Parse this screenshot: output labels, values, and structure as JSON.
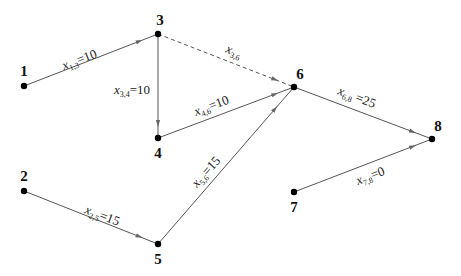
{
  "diagram": {
    "type": "directed-network-flow",
    "nodes": [
      {
        "id": "1",
        "label": "1",
        "x": 24,
        "y": 86,
        "lx": 24,
        "ly": 76,
        "anchor": "middle"
      },
      {
        "id": "2",
        "label": "2",
        "x": 24,
        "y": 191,
        "lx": 24,
        "ly": 181,
        "anchor": "middle"
      },
      {
        "id": "3",
        "label": "3",
        "x": 158,
        "y": 34,
        "lx": 160,
        "ly": 25,
        "anchor": "middle"
      },
      {
        "id": "4",
        "label": "4",
        "x": 158,
        "y": 138,
        "lx": 158,
        "ly": 158,
        "anchor": "middle"
      },
      {
        "id": "5",
        "label": "5",
        "x": 158,
        "y": 244,
        "lx": 158,
        "ly": 264,
        "anchor": "middle"
      },
      {
        "id": "6",
        "label": "6",
        "x": 294,
        "y": 87,
        "lx": 300,
        "ly": 79,
        "anchor": "middle"
      },
      {
        "id": "7",
        "label": "7",
        "x": 294,
        "y": 192,
        "lx": 294,
        "ly": 212,
        "anchor": "middle"
      },
      {
        "id": "8",
        "label": "8",
        "x": 432,
        "y": 139,
        "lx": 438,
        "ly": 131,
        "anchor": "middle"
      }
    ],
    "edges": [
      {
        "from": "1",
        "to": "3",
        "var": "x",
        "sub": "1,3",
        "value": "=10",
        "dashed": false,
        "lx": 64,
        "ly": 70,
        "rot": -21
      },
      {
        "from": "3",
        "to": "4",
        "var": "x",
        "sub": "3,4",
        "value": "=10",
        "dashed": false,
        "lx": 114,
        "ly": 94,
        "rot": 0
      },
      {
        "from": "3",
        "to": "6",
        "var": "x",
        "sub": "3,6",
        "value": "",
        "dashed": true,
        "lx": 225,
        "ly": 52,
        "rot": 22
      },
      {
        "from": "4",
        "to": "6",
        "var": "x",
        "sub": "4,6",
        "value": "=10",
        "dashed": false,
        "lx": 196,
        "ly": 116,
        "rot": -21
      },
      {
        "from": "5",
        "to": "6",
        "var": "x",
        "sub": "5,6",
        "value": "=15",
        "dashed": false,
        "lx": 197,
        "ly": 188,
        "rot": -48
      },
      {
        "from": "2",
        "to": "5",
        "var": "x",
        "sub": "2,5",
        "value": "=15",
        "dashed": false,
        "lx": 84,
        "ly": 213,
        "rot": 21
      },
      {
        "from": "6",
        "to": "8",
        "var": "x",
        "sub": "6,8",
        "value": " =25",
        "dashed": false,
        "lx": 337,
        "ly": 94,
        "rot": 21
      },
      {
        "from": "7",
        "to": "8",
        "var": "x",
        "sub": "7,8",
        "value": "=0",
        "dashed": false,
        "lx": 358,
        "ly": 185,
        "rot": -21
      }
    ]
  },
  "colors": {
    "edge": "#555555",
    "node": "#000000",
    "text": "#111111",
    "background": "#ffffff"
  }
}
